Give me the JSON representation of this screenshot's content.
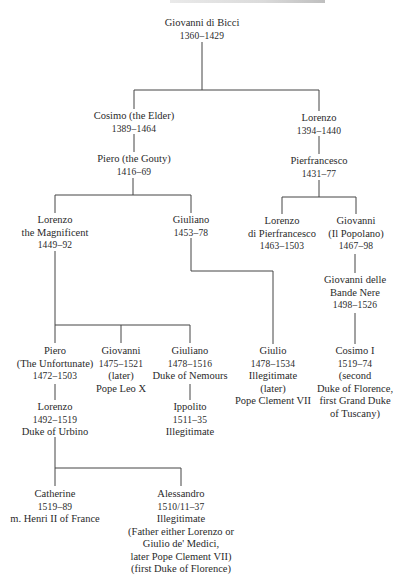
{
  "tree": {
    "nodes": {
      "giovanni_di_bicci": {
        "lines": [
          "Giovanni di Bicci"
        ],
        "dates": "1360–1429",
        "notes": []
      },
      "cosimo_elder": {
        "lines": [
          "Cosimo (the Elder)"
        ],
        "dates": "1389–1464",
        "notes": []
      },
      "lorenzo_1394": {
        "lines": [
          "Lorenzo"
        ],
        "dates": "1394–1440",
        "notes": []
      },
      "piero_gouty": {
        "lines": [
          "Piero (the Gouty)"
        ],
        "dates": "1416–69",
        "notes": []
      },
      "pierfrancesco": {
        "lines": [
          "Pierfrancesco"
        ],
        "dates": "1431–77",
        "notes": []
      },
      "lorenzo_magnificent": {
        "lines": [
          "Lorenzo",
          "the Magnificent"
        ],
        "dates": "1449–92",
        "notes": []
      },
      "giuliano_1453": {
        "lines": [
          "Giuliano"
        ],
        "dates": "1453–78",
        "notes": []
      },
      "lorenzo_di_pierfrancesco": {
        "lines": [
          "Lorenzo",
          "di Pierfrancesco"
        ],
        "dates": "1463–1503",
        "notes": []
      },
      "giovanni_popolano": {
        "lines": [
          "Giovanni",
          "(Il Popolano)"
        ],
        "dates": "1467–98",
        "notes": []
      },
      "giovanni_bande_nere": {
        "lines": [
          "Giovanni delle",
          "Bande Nere"
        ],
        "dates": "1498–1526",
        "notes": []
      },
      "piero_unfortunate": {
        "lines": [
          "Piero",
          "(The Unfortunate)"
        ],
        "dates": "1472–1503",
        "notes": []
      },
      "giovanni_leo_x": {
        "lines": [
          "Giovanni"
        ],
        "dates": "1475–1521",
        "notes": [
          "(later)",
          "Pope Leo X"
        ]
      },
      "giuliano_nemours": {
        "lines": [
          "Giuliano"
        ],
        "dates": "1478–1516",
        "notes": [
          "Duke of Nemours"
        ]
      },
      "giulio": {
        "lines": [
          "Giulio"
        ],
        "dates": "1478–1534",
        "notes": [
          "Illegitimate",
          "(later)",
          "Pope Clement VII"
        ]
      },
      "cosimo_i": {
        "lines": [
          "Cosimo I"
        ],
        "dates": "1519–74",
        "notes": [
          "(second",
          "Duke of Florence,",
          "first Grand Duke",
          "of Tuscany)"
        ]
      },
      "lorenzo_urbino": {
        "lines": [
          "Lorenzo"
        ],
        "dates": "1492–1519",
        "notes": [
          "Duke of Urbino"
        ]
      },
      "ippolito": {
        "lines": [
          "Ippolito"
        ],
        "dates": "1511–35",
        "notes": [
          "Illegitimate"
        ]
      },
      "catherine": {
        "lines": [
          "Catherine"
        ],
        "dates": "1519–89",
        "notes": [
          "m. Henri II of France"
        ]
      },
      "alessandro": {
        "lines": [
          "Alessandro"
        ],
        "dates": "1510/11–37",
        "notes": [
          "Illegitimate",
          "(Father either Lorenzo or",
          "Giulio de' Medici,",
          "later Pope Clement VII)",
          "(first Duke of Florence)"
        ]
      }
    },
    "relations": [
      {
        "parent": "giovanni_di_bicci",
        "children": [
          "cosimo_elder",
          "lorenzo_1394"
        ]
      },
      {
        "parent": "cosimo_elder",
        "children": [
          "piero_gouty"
        ]
      },
      {
        "parent": "lorenzo_1394",
        "children": [
          "pierfrancesco"
        ]
      },
      {
        "parent": "piero_gouty",
        "children": [
          "lorenzo_magnificent",
          "giuliano_1453"
        ]
      },
      {
        "parent": "pierfrancesco",
        "children": [
          "lorenzo_di_pierfrancesco",
          "giovanni_popolano"
        ]
      },
      {
        "parent": "giovanni_popolano",
        "children": [
          "giovanni_bande_nere"
        ]
      },
      {
        "parent": "giovanni_bande_nere",
        "children": [
          "cosimo_i"
        ]
      },
      {
        "parent": "lorenzo_magnificent",
        "children": [
          "piero_unfortunate",
          "giovanni_leo_x",
          "giuliano_nemours"
        ]
      },
      {
        "parent": "giuliano_1453",
        "children": [
          "giulio"
        ]
      },
      {
        "parent": "piero_unfortunate",
        "children": [
          "lorenzo_urbino"
        ]
      },
      {
        "parent": "giuliano_nemours",
        "children": [
          "ippolito"
        ]
      },
      {
        "parent": "lorenzo_urbino",
        "children": [
          "catherine",
          "alessandro"
        ]
      }
    ]
  }
}
